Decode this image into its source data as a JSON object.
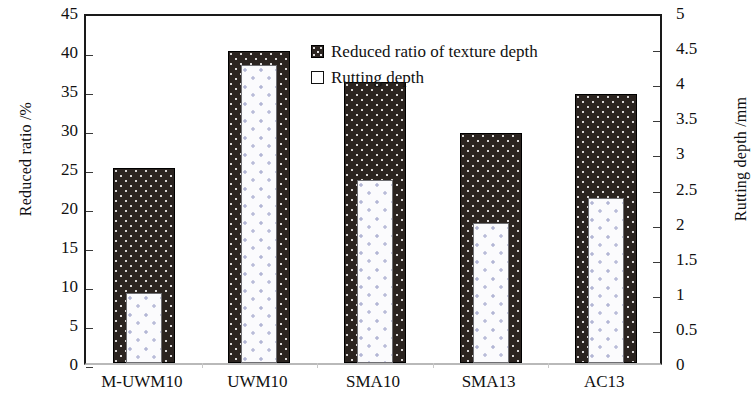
{
  "chart_data": {
    "type": "bar",
    "title": "",
    "subtitle": "",
    "xlabel": "",
    "categories": [
      "M-UWM10",
      "UWM10",
      "SMA10",
      "SMA13",
      "AC13"
    ],
    "grid": false,
    "legend_position": "top-center",
    "series": [
      {
        "name": "Reduced ratio of texture depth",
        "axis": "left",
        "unit": "%",
        "values": [
          25,
          40,
          36,
          29.5,
          34.5
        ],
        "fill": "dark-dotted",
        "color": "#2b2420"
      },
      {
        "name": "Rutting depth",
        "axis": "right",
        "unit": "mm",
        "values": [
          1.0,
          4.25,
          2.6,
          2.0,
          2.35
        ],
        "fill": "light-dotted",
        "color": "#fbfbfd"
      }
    ],
    "axes": {
      "left": {
        "label": "Reduced ratio /%",
        "min": 0,
        "max": 45,
        "step": 5,
        "ticks": [
          "45",
          "40",
          "35",
          "30",
          "25",
          "20",
          "15",
          "10",
          "5",
          "0"
        ]
      },
      "right": {
        "label": "Rutting depth /mm",
        "min": 0,
        "max": 5,
        "step": 0.5,
        "ticks": [
          "5",
          "4.5",
          "4",
          "3.5",
          "3",
          "2.5",
          "2",
          "1.5",
          "1",
          "0.5",
          "0"
        ]
      }
    }
  },
  "legend": {
    "items": [
      {
        "label": "Reduced ratio of texture depth",
        "swatch": "dark-dotted-square-icon"
      },
      {
        "label": "Rutting depth",
        "swatch": "white-square-icon"
      }
    ]
  }
}
